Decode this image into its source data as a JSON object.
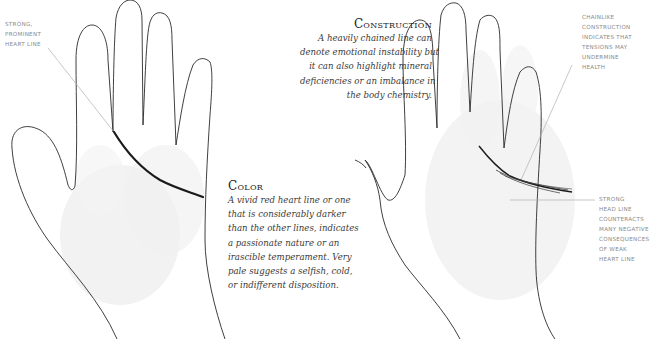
{
  "left_hand": {
    "label": [
      "Strong,",
      "Prominent",
      "Heart Line"
    ]
  },
  "construction": {
    "heading": "Construction",
    "body_lines": [
      "A heavily chained line can",
      "denote emotional instability but",
      "it can also highlight mineral",
      "deficiencies or an imbalance in",
      "the body chemistry."
    ]
  },
  "color_section": {
    "heading": "Color",
    "body_lines": [
      "A vivid red heart line or one",
      "that is considerably darker",
      "than the other lines, indicates",
      "a passionate nature or an",
      "irascible temperament. Very",
      "pale suggests a selfish, cold,",
      "or indifferent disposition."
    ]
  },
  "right_hand": {
    "top_label": [
      "Chainlike",
      "Construction",
      "Indicates that",
      "Tensions may",
      "Undermine",
      "Health"
    ],
    "bottom_label": [
      "Strong",
      "Head Line",
      "Counteracts",
      "Many Negative",
      "Consequences",
      "of Weak",
      "Heart Line"
    ]
  },
  "colors": {
    "outline": "#2a2a2a",
    "heart_line": "#1a1a1a",
    "leader_line": "#b0b0b0",
    "palm_shading": "#ececec",
    "label_text": "#8a8a8a"
  }
}
